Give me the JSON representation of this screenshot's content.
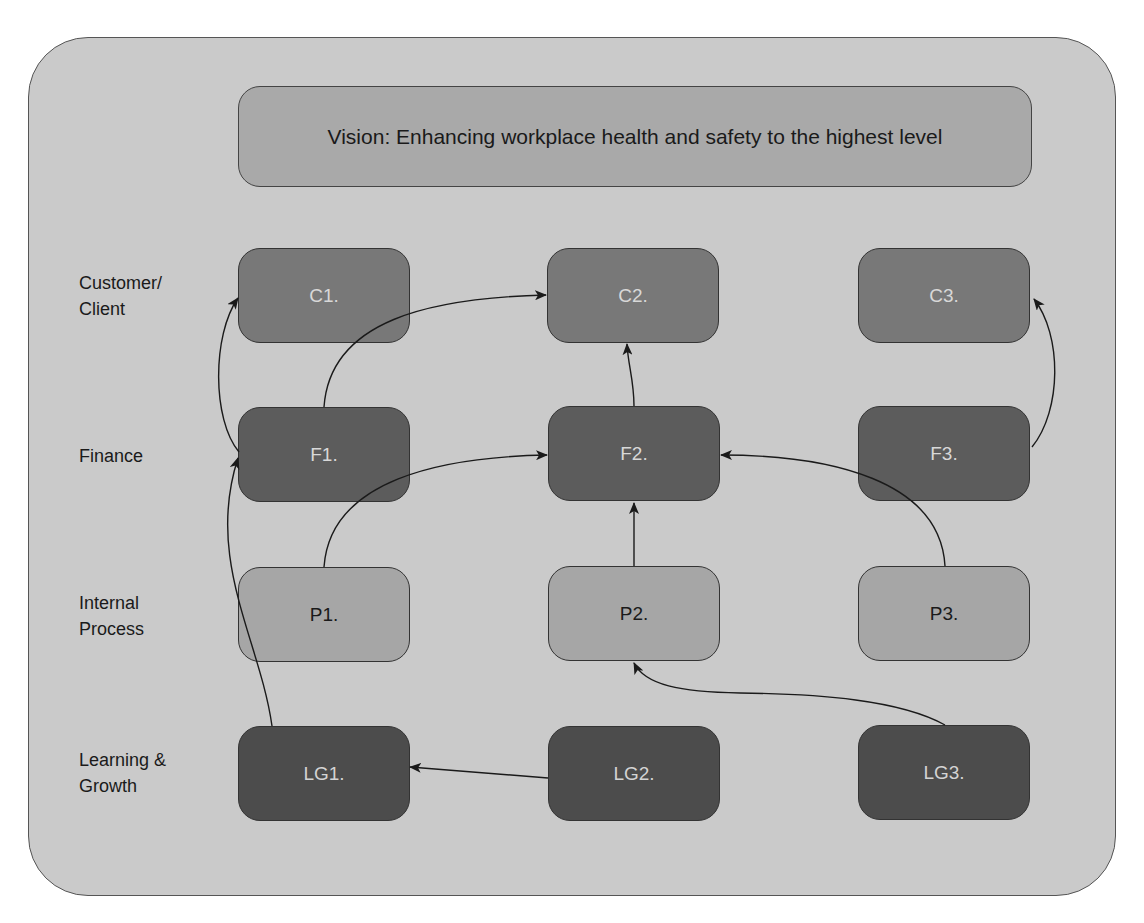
{
  "vision": {
    "text": "Vision: Enhancing workplace health and safety to the highest level"
  },
  "perspectives": [
    {
      "id": "customer",
      "label_line1": "Customer/",
      "label_line2": "Client"
    },
    {
      "id": "finance",
      "label_line1": "Finance",
      "label_line2": ""
    },
    {
      "id": "internal",
      "label_line1": "Internal",
      "label_line2": "Process"
    },
    {
      "id": "learning",
      "label_line1": "Learning &",
      "label_line2": "Growth"
    }
  ],
  "nodes": {
    "C1": "C1.",
    "C2": "C2.",
    "C3": "C3.",
    "F1": "F1.",
    "F2": "F2.",
    "F3": "F3.",
    "P1": "P1.",
    "P2": "P2.",
    "P3": "P3.",
    "LG1": "LG1.",
    "LG2": "LG2.",
    "LG3": "LG3."
  },
  "edges": [
    {
      "from": "F1",
      "to": "C1"
    },
    {
      "from": "F1",
      "to": "C2"
    },
    {
      "from": "F2",
      "to": "C2"
    },
    {
      "from": "F3",
      "to": "C3"
    },
    {
      "from": "P1",
      "to": "F2"
    },
    {
      "from": "P2",
      "to": "F2"
    },
    {
      "from": "P3",
      "to": "F2"
    },
    {
      "from": "LG1",
      "to": "F1"
    },
    {
      "from": "LG2",
      "to": "LG1"
    },
    {
      "from": "LG3",
      "to": "P2"
    }
  ],
  "colors": {
    "background": "#cacaca",
    "vision": "#a9a9a9",
    "customer": "#787878",
    "finance": "#5c5c5c",
    "internal": "#a6a6a6",
    "learning": "#4c4c4c"
  }
}
